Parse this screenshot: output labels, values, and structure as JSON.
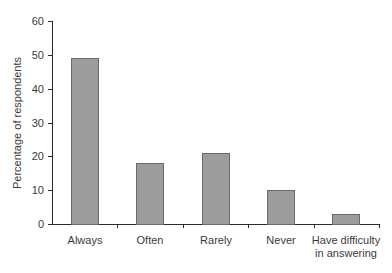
{
  "chart_data": {
    "type": "bar",
    "title": "",
    "xlabel": "",
    "ylabel": "Percentage of respondents",
    "categories": [
      "Always",
      "Often",
      "Rarely",
      "Never",
      "Have difficulty in answering"
    ],
    "category_lines": [
      [
        "Always"
      ],
      [
        "Often"
      ],
      [
        "Rarely"
      ],
      [
        "Never"
      ],
      [
        "Have difficulty",
        "in answering"
      ]
    ],
    "values": [
      49,
      18,
      21,
      10,
      3
    ],
    "ylim": [
      0,
      60
    ],
    "yticks": [
      0,
      10,
      20,
      30,
      40,
      50,
      60
    ],
    "grid": false,
    "legend": null,
    "colors": {
      "bar_fill": "#9c9c9c",
      "bar_edge": "#6a6a6a",
      "axis": "#2a2a2a"
    }
  }
}
